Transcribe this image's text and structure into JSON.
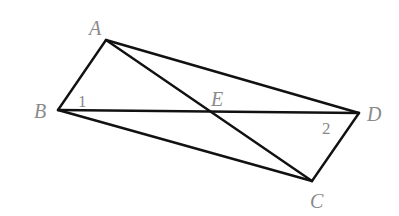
{
  "diagram": {
    "points": {
      "A": {
        "label": "A",
        "x": 106,
        "y": 40,
        "lx": 89,
        "ly": 35
      },
      "B": {
        "label": "B",
        "x": 58,
        "y": 110,
        "lx": 34,
        "ly": 118
      },
      "C": {
        "label": "C",
        "x": 312,
        "y": 181,
        "lx": 310,
        "ly": 208
      },
      "D": {
        "label": "D",
        "x": 359,
        "y": 113,
        "lx": 367,
        "ly": 121
      },
      "E": {
        "label": "E",
        "x": 209,
        "y": 112,
        "lx": 211,
        "ly": 106
      }
    },
    "segments": [
      "AB",
      "AD",
      "AC",
      "BD",
      "BC",
      "CD"
    ],
    "angle_labels": [
      {
        "text": "1",
        "x": 78,
        "y": 107
      },
      {
        "text": "2",
        "x": 322,
        "y": 134
      }
    ]
  }
}
